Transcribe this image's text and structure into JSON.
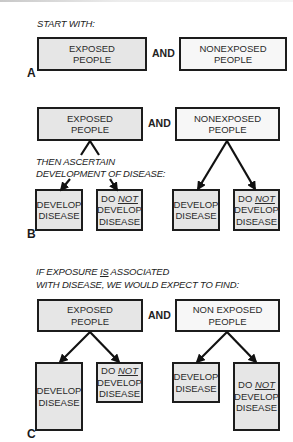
{
  "panels": {
    "a": {
      "label": "A",
      "heading": "START WITH:",
      "exposed": {
        "line1": "EXPOSED",
        "line2": "PEOPLE"
      },
      "connector": "AND",
      "nonexposed": {
        "line1": "NONEXPOSED",
        "line2": "PEOPLE"
      }
    },
    "b": {
      "label": "B",
      "exposed": {
        "line1": "EXPOSED",
        "line2": "PEOPLE"
      },
      "connector": "AND",
      "nonexposed": {
        "line1": "NONEXPOSED",
        "line2": "PEOPLE"
      },
      "instruction_line1": "THEN ASCERTAIN",
      "instruction_line2": "DEVELOPMENT OF DISEASE:",
      "outcomes": {
        "develop": {
          "line1": "DEVELOP",
          "line2": "DISEASE"
        },
        "not_develop": {
          "prefix": "DO ",
          "emphasis": "NOT",
          "line2": "DEVELOP",
          "line3": "DISEASE"
        }
      }
    },
    "c": {
      "label": "C",
      "heading_part1": "IF EXPOSURE ",
      "heading_emphasis": "IS",
      "heading_part2": " ASSOCIATED",
      "heading_line2": "WITH DISEASE, WE WOULD EXPECT TO FIND:",
      "exposed": {
        "line1": "EXPOSED",
        "line2": "PEOPLE"
      },
      "connector": "AND",
      "nonexposed": {
        "line1": "NON EXPOSED",
        "line2": "PEOPLE"
      },
      "outcomes": {
        "develop": {
          "line1": "DEVELOP",
          "line2": "DISEASE"
        },
        "not_develop": {
          "prefix": "DO ",
          "emphasis": "NOT",
          "line2": "DEVELOP",
          "line3": "DISEASE"
        }
      }
    }
  },
  "colors": {
    "exposed_fill": "#e6e6e6",
    "nonexposed_fill": "#f7f7f7",
    "outcome_fill": "#eaeaea",
    "border": "#1c1c1c"
  }
}
